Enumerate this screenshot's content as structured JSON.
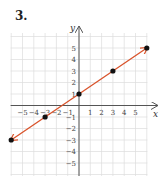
{
  "problem_number": "3.",
  "chart_data": {
    "type": "line",
    "title": "",
    "xlabel": "x",
    "ylabel": "y",
    "xlim": [
      -6,
      6
    ],
    "ylim": [
      -6,
      6
    ],
    "grid": true,
    "x_tick_labels": [
      "−5",
      "−4",
      "−3",
      "−2",
      "−1",
      "1",
      "2",
      "3",
      "4",
      "5"
    ],
    "y_tick_labels": [
      "5",
      "4",
      "3",
      "2",
      "1",
      "−1",
      "−2",
      "−3",
      "−4",
      "−5"
    ],
    "points": [
      {
        "x": -6,
        "y": -3
      },
      {
        "x": -3,
        "y": -1
      },
      {
        "x": 0,
        "y": 1
      },
      {
        "x": 3,
        "y": 3
      },
      {
        "x": 6,
        "y": 5
      }
    ],
    "line": {
      "from": [
        -6,
        -3
      ],
      "to": [
        6,
        5
      ],
      "arrows": "both",
      "color": "#d9532b"
    },
    "point_color": "#111111",
    "axis_color": "#555555",
    "grid_color": "#dddddd"
  }
}
